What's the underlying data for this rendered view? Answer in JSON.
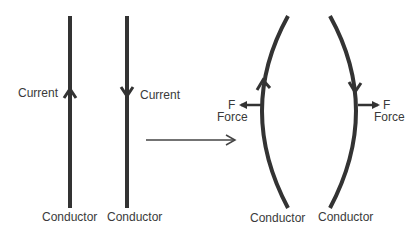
{
  "diagram": {
    "left_panel": {
      "conductors": [
        {
          "label": "Conductor",
          "current_label": "Current",
          "current_direction": "up"
        },
        {
          "label": "Conductor",
          "current_label": "Current",
          "current_direction": "down"
        }
      ]
    },
    "transition_arrow": "arrow-right",
    "right_panel": {
      "conductors": [
        {
          "label": "Conductor",
          "current_direction": "up",
          "force_symbol": "F",
          "force_label": "Force",
          "force_direction": "left"
        },
        {
          "label": "Conductor",
          "current_direction": "down",
          "force_symbol": "F",
          "force_label": "Force",
          "force_direction": "right"
        }
      ]
    },
    "colors": {
      "line": "#333333",
      "text": "#3a3a3a",
      "background": "#ffffff"
    }
  }
}
